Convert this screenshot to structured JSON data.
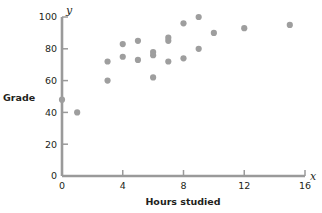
{
  "chart_data": {
    "type": "scatter",
    "title": "",
    "xlabel": "Hours studied",
    "ylabel": "Grade",
    "x_axis_variable": "x",
    "y_axis_variable": "y",
    "xlim": [
      0,
      16
    ],
    "ylim": [
      0,
      100
    ],
    "xticks": [
      0,
      4,
      8,
      12,
      16
    ],
    "yticks": [
      0,
      20,
      40,
      60,
      80,
      100
    ],
    "xtick_labels": [
      "0",
      "4",
      "8",
      "12",
      "16"
    ],
    "ytick_labels": [
      "0",
      "20",
      "40",
      "60",
      "80",
      "100"
    ],
    "grid": false,
    "legend": false,
    "series": [
      {
        "name": "students",
        "marker": "circle",
        "color": "#9e9e9e",
        "points": [
          [
            0,
            48
          ],
          [
            1,
            40
          ],
          [
            3,
            60
          ],
          [
            3,
            72
          ],
          [
            4,
            75
          ],
          [
            4,
            83
          ],
          [
            5,
            73
          ],
          [
            5,
            85
          ],
          [
            6,
            62
          ],
          [
            6,
            76
          ],
          [
            6,
            78
          ],
          [
            7,
            72
          ],
          [
            7,
            85
          ],
          [
            7,
            87
          ],
          [
            8,
            74
          ],
          [
            8,
            96
          ],
          [
            9,
            80
          ],
          [
            9,
            100
          ],
          [
            10,
            90
          ],
          [
            12,
            93
          ],
          [
            15,
            95
          ]
        ]
      }
    ]
  },
  "colors": {
    "axis": "#9a9a9a",
    "text": "#231f20",
    "marker": "#9e9e9e",
    "background": "#ffffff"
  }
}
